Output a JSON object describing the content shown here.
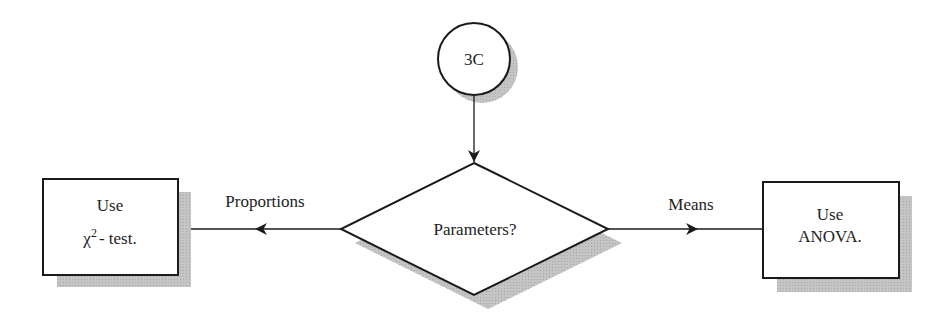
{
  "diagram": {
    "type": "flowchart",
    "connector": {
      "id": "3C",
      "label": "3C"
    },
    "decision": {
      "label": "Parameters?"
    },
    "branches": [
      {
        "label": "Proportions",
        "direction": "left",
        "target": "chi-square-box"
      },
      {
        "label": "Means",
        "direction": "right",
        "target": "anova-box"
      }
    ],
    "boxes": {
      "left": {
        "line1": "Use",
        "chi": "χ",
        "sup": "2",
        "rest": "- test."
      },
      "right": {
        "line1": "Use",
        "line2": "ANOVA."
      }
    },
    "colors": {
      "stroke": "#1a1a1a",
      "shadow": "#b5b5b5",
      "fill": "#ffffff"
    }
  }
}
